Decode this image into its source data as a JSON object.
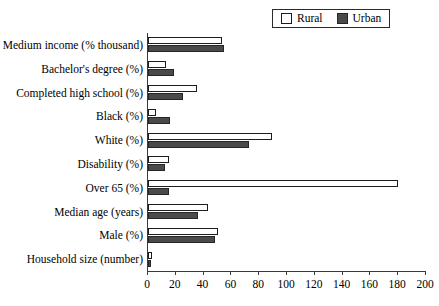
{
  "chart_data": {
    "type": "bar",
    "orientation": "horizontal",
    "title": "",
    "subtitle": "",
    "xlabel": "",
    "ylabel": "",
    "xlim": [
      0,
      200
    ],
    "xticks": [
      0,
      20,
      40,
      60,
      80,
      100,
      120,
      140,
      160,
      180,
      200
    ],
    "grid": false,
    "legend_position": "top-right",
    "categories": [
      "Medium income (% thousand)",
      "Bachelor's degree (%)",
      "Completed high school (%)",
      "Black (%)",
      "White (%)",
      "Disability (%)",
      "Over 65 (%)",
      "Median age (years)",
      "Male (%)",
      "Household size (number)"
    ],
    "series": [
      {
        "name": "Rural",
        "color": "#ffffff",
        "edge_color": "#1c1c1c",
        "values": [
          53,
          13,
          35,
          6,
          89,
          15,
          180,
          43,
          50,
          3
        ]
      },
      {
        "name": "Urban",
        "color": "#4a4a4a",
        "edge_color": "#262626",
        "values": [
          55,
          19,
          25,
          16,
          73,
          12,
          15,
          36,
          48,
          2
        ]
      }
    ]
  },
  "legend": {
    "entries": [
      {
        "label": "Rural",
        "swatch": "rural-swatch"
      },
      {
        "label": "Urban",
        "swatch": "urban-swatch"
      }
    ]
  }
}
